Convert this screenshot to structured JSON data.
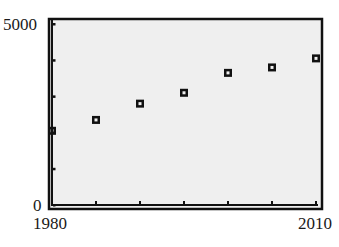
{
  "chart_data": {
    "type": "scatter",
    "title": "",
    "xlabel": "",
    "ylabel": "",
    "x": [
      1980,
      1985,
      1990,
      1995,
      2000,
      2005,
      2010
    ],
    "values": [
      2050,
      2350,
      2800,
      3100,
      3650,
      3800,
      4050
    ],
    "series": [
      {
        "name": "data",
        "marker": "hollow-square",
        "x": [
          1980,
          1985,
          1990,
          1995,
          2000,
          2005,
          2010
        ],
        "values": [
          2050,
          2350,
          2800,
          3100,
          3650,
          3800,
          4050
        ]
      }
    ],
    "xlim": [
      1980,
      2010
    ],
    "ylim": [
      0,
      5000
    ],
    "x_ticks_every": 5,
    "y_ticks_every": 1000,
    "x_tick_labels": [
      "1980",
      "2010"
    ],
    "y_tick_labels": [
      "0",
      "5000"
    ],
    "grid": false,
    "legend": null
  },
  "axes": {
    "y_max_label": "5000",
    "y_min_label": "0",
    "x_min_label": "1980",
    "x_max_label": "2010"
  },
  "colors": {
    "background": "#ffffff",
    "plot_area": "#efefef",
    "frame": "#111111",
    "marker": "#111111"
  }
}
